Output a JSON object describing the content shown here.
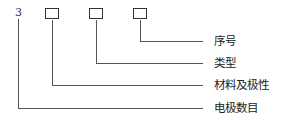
{
  "diagram": {
    "prefix_number": "3",
    "fields": [
      {
        "label": "序号"
      },
      {
        "label": "类型"
      },
      {
        "label": "材料及极性"
      },
      {
        "label": "电极数目"
      }
    ]
  }
}
